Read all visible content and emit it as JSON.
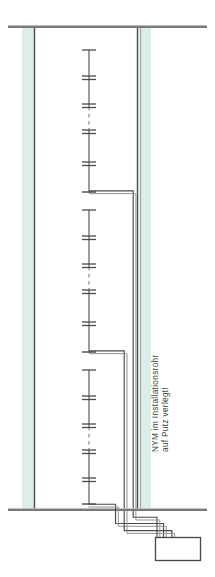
{
  "drawing": {
    "title": "Elektro-Installationsschnitt",
    "annotation": {
      "line1": "NYM im Installationsrohr",
      "line2": "auf Putz verlegt!"
    },
    "colors": {
      "wall_fill": "#dceee4",
      "line_dark": "#3a3a3a",
      "line_mid": "#6b6b6b",
      "line_light": "#8d8d8d",
      "background": "#ffffff"
    },
    "elements": {
      "ceiling_label": "Decke",
      "floor_label": "Fussboden",
      "left_wall_label": "Wand links",
      "right_wall_label": "Wand rechts",
      "riser_label": "Steigleitung",
      "branch_upper_label": "Abzweig oben",
      "branch_lower_label": "Abzweig unten",
      "junction_box_label": "Verteilerkasten",
      "conduit_bundle_label": "Leitungsbuendel"
    },
    "geometry": {
      "ceiling_y": 27,
      "floor_y": 510,
      "left_wall_x": 35,
      "right_wall_x": 137,
      "riser_x": 89,
      "branch_upper_y": 192,
      "branch_lower_y": 352,
      "junction_box": {
        "x": 155,
        "y": 537,
        "w": 45,
        "h": 23
      }
    }
  }
}
